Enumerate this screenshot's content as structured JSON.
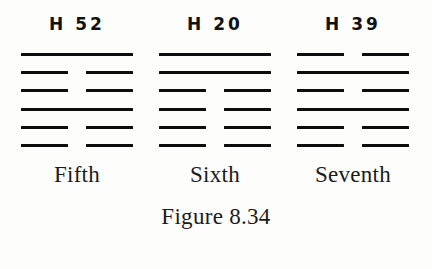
{
  "figure": {
    "caption": "Figure 8.34",
    "background_color": "#fdfdfc",
    "line_color": "#0d0d0d"
  },
  "hexagrams": [
    {
      "title": "H 52",
      "label": "Fifth",
      "lines": [
        {
          "type": "yang",
          "segments": 1
        },
        {
          "type": "yin",
          "segments": 2
        },
        {
          "type": "yin",
          "segments": 2
        },
        {
          "type": "yang",
          "segments": 1
        },
        {
          "type": "yin",
          "segments": 2
        },
        {
          "type": "yin",
          "segments": 2
        }
      ]
    },
    {
      "title": "H 20",
      "label": "Sixth",
      "lines": [
        {
          "type": "yang",
          "segments": 1
        },
        {
          "type": "yang",
          "segments": 1
        },
        {
          "type": "yin",
          "segments": 2
        },
        {
          "type": "yin",
          "segments": 2
        },
        {
          "type": "yin",
          "segments": 2
        },
        {
          "type": "yin",
          "segments": 2
        }
      ]
    },
    {
      "title": "H 39",
      "label": "Seventh",
      "lines": [
        {
          "type": "yin",
          "segments": 2
        },
        {
          "type": "yang",
          "segments": 1
        },
        {
          "type": "yin",
          "segments": 2
        },
        {
          "type": "yang",
          "segments": 1
        },
        {
          "type": "yin",
          "segments": 2
        },
        {
          "type": "yin",
          "segments": 2
        }
      ]
    }
  ]
}
